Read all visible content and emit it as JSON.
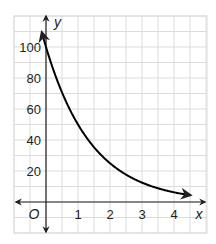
{
  "chart_data": {
    "type": "line",
    "title": "",
    "xlabel": "x",
    "ylabel": "y",
    "origin_label": "O",
    "xlim": [
      -1,
      4.6
    ],
    "ylim": [
      -20,
      110
    ],
    "x_ticks": [
      1,
      2,
      3,
      4
    ],
    "y_ticks": [
      20,
      40,
      60,
      80,
      100
    ],
    "x_tick_labels": [
      "1",
      "2",
      "3",
      "4"
    ],
    "y_tick_labels": [
      "20",
      "40",
      "60",
      "80",
      "100"
    ],
    "grid": true,
    "grid_step": {
      "x": 0.5,
      "y": 10
    },
    "series": [
      {
        "name": "y = 100(0.5)^x",
        "x": [
          -0.13,
          0,
          0.5,
          1,
          1.5,
          2,
          2.5,
          3,
          3.5,
          4,
          4.5
        ],
        "values": [
          109,
          100,
          70.7,
          50,
          35.4,
          25,
          17.7,
          12.5,
          8.8,
          6.25,
          4.4
        ],
        "color": "#000000"
      }
    ],
    "legend": null
  },
  "colors": {
    "grid": "#dcdcdc",
    "axis": "#231f20",
    "curve": "#000000"
  }
}
